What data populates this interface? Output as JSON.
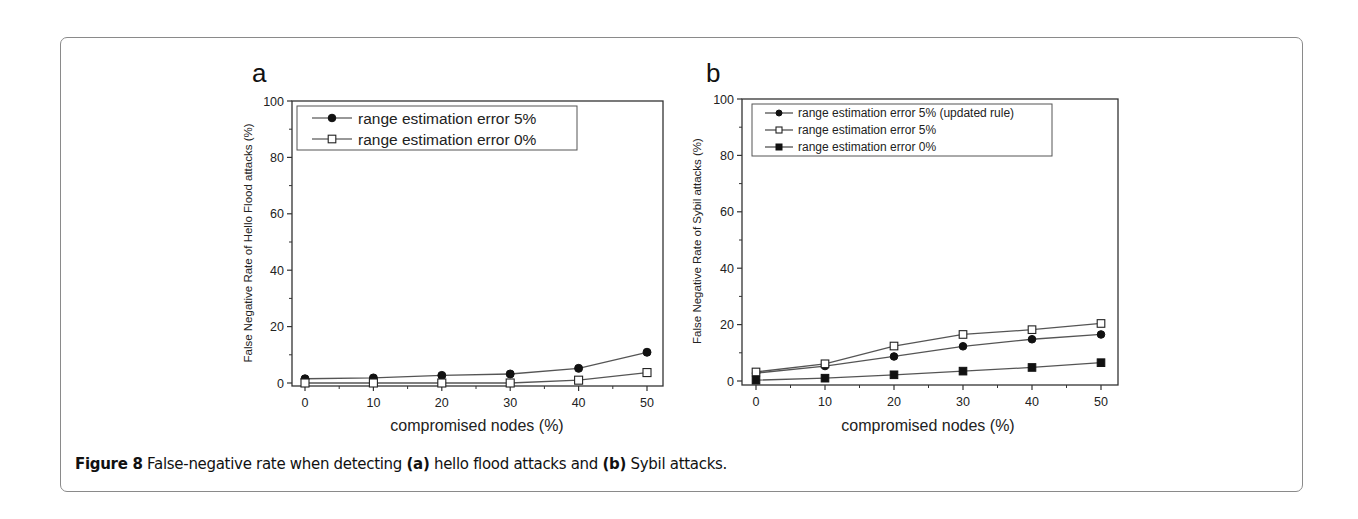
{
  "figure": {
    "caption_label": "Figure 8",
    "caption_text": " False-negative rate when detecting ",
    "caption_a": "(a)",
    "caption_mid": " hello flood attacks and ",
    "caption_b": "(b)",
    "caption_end": " Sybil attacks."
  },
  "colors": {
    "line": "#555555",
    "marker": "#111111",
    "axis": "#333333",
    "frame": "#8a8a8a"
  },
  "chart_data": [
    {
      "panel": "a",
      "type": "line",
      "title": "",
      "xlabel": "compromised nodes (%)",
      "ylabel": "False Negative Rate of Hello Flood attacks (%)",
      "x": [
        0,
        10,
        20,
        30,
        40,
        50
      ],
      "xticks": [
        0,
        10,
        20,
        30,
        40,
        50
      ],
      "yticks": [
        0,
        20,
        40,
        60,
        80,
        100
      ],
      "xlim": [
        -3,
        52.5
      ],
      "ylim": [
        -1,
        100
      ],
      "grid": false,
      "legend_position": "upper left",
      "series": [
        {
          "name": "range estimation error 5%",
          "marker": "filled-circle",
          "values": [
            1.5,
            1.8,
            2.7,
            3.2,
            5.2,
            10.9
          ]
        },
        {
          "name": "range estimation error 0%",
          "marker": "open-square",
          "values": [
            0,
            0,
            0,
            0,
            1.0,
            3.7
          ]
        }
      ]
    },
    {
      "panel": "b",
      "type": "line",
      "title": "",
      "xlabel": "compromised nodes (%)",
      "ylabel": "False Negative Rate of Sybil attacks (%)",
      "x": [
        0,
        10,
        20,
        30,
        40,
        50
      ],
      "xticks": [
        0,
        10,
        20,
        30,
        40,
        50
      ],
      "yticks": [
        0,
        20,
        40,
        60,
        80,
        100
      ],
      "xlim": [
        -2,
        52
      ],
      "ylim": [
        -1,
        100
      ],
      "grid": false,
      "legend_position": "upper left",
      "series": [
        {
          "name": "range estimation error 5% (updated rule)",
          "marker": "filled-circle",
          "values": [
            2.8,
            5.3,
            8.7,
            12.3,
            14.8,
            16.5
          ]
        },
        {
          "name": "range estimation error 5%",
          "marker": "open-square",
          "values": [
            3.2,
            6.1,
            12.4,
            16.5,
            18.2,
            20.4
          ]
        },
        {
          "name": "range estimation error 0%",
          "marker": "filled-square",
          "values": [
            0.3,
            1.0,
            2.2,
            3.5,
            4.8,
            6.5
          ]
        }
      ]
    }
  ]
}
